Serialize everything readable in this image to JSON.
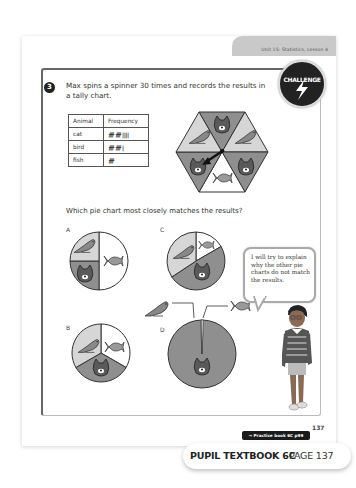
{
  "header": {
    "unit_label": "Unit 15: Statistics, Lesson 4",
    "page_number": "137"
  },
  "badge": {
    "label": "CHALLENGE",
    "icon": "lightning-icon"
  },
  "question": {
    "number": "3",
    "text": "Max spins a spinner 30 times and records the results in a tally chart.",
    "prompt": "Which pie chart most closely matches the results?"
  },
  "tally_chart": {
    "headers": [
      "Animal",
      "Frequency"
    ],
    "rows": [
      {
        "animal": "cat",
        "tally": "𝍸 𝍸 ||||",
        "tally_display": "卌 卌 ||||",
        "count": 14
      },
      {
        "animal": "bird",
        "tally": "𝍸 𝍸 |",
        "tally_display": "卌 卌 |",
        "count": 11
      },
      {
        "animal": "fish",
        "tally": "𝍸",
        "tally_display": "卌",
        "count": 5
      }
    ]
  },
  "spinner": {
    "shape": "hexagon",
    "sections": [
      "cat",
      "bird",
      "cat",
      "fish",
      "cat",
      "bird"
    ]
  },
  "pie_charts": [
    {
      "label": "A",
      "slices": [
        {
          "animal": "fish",
          "fraction": 0.5
        },
        {
          "animal": "cat",
          "fraction": 0.25
        },
        {
          "animal": "bird",
          "fraction": 0.25
        }
      ]
    },
    {
      "label": "B",
      "slices": [
        {
          "animal": "fish",
          "fraction": 0.3333
        },
        {
          "animal": "cat",
          "fraction": 0.3333
        },
        {
          "animal": "bird",
          "fraction": 0.3333
        }
      ]
    },
    {
      "label": "C",
      "slices": [
        {
          "animal": "fish",
          "fraction": 0.1667
        },
        {
          "animal": "cat",
          "fraction": 0.4667
        },
        {
          "animal": "bird",
          "fraction": 0.3667
        }
      ]
    },
    {
      "label": "D",
      "slices": [
        {
          "animal": "fish",
          "fraction": 0.02
        },
        {
          "animal": "cat",
          "fraction": 0.96
        },
        {
          "animal": "bird",
          "fraction": 0.02
        }
      ]
    }
  ],
  "speech_bubble": {
    "text": "I will try to explain why the other pie charts do not match the results."
  },
  "practice_link": "→ Practice book 6C p99",
  "footer": {
    "book": "PUPIL TEXTBOOK 6C",
    "page": "PAGE 137"
  },
  "colors": {
    "cat_fill": "#8f8f8f",
    "bird_fill": "#d6d6d6",
    "fish_fill": "#ffffff",
    "outline": "#333333",
    "header_tab": "#c9c9c9"
  }
}
